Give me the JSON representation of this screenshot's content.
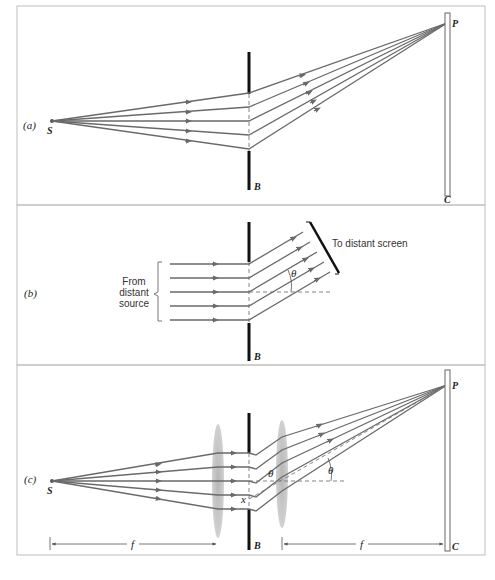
{
  "figure": {
    "panels": [
      {
        "id": "a",
        "label": "(a)",
        "source_label": "S",
        "barrier_label": "B",
        "point_label": "P",
        "screen_label": "C"
      },
      {
        "id": "b",
        "label": "(b)",
        "incoming_label_line1": "From",
        "incoming_label_line2": "distant",
        "incoming_label_line3": "source",
        "outgoing_label": "To distant screen",
        "angle_label": "θ",
        "barrier_label": "B"
      },
      {
        "id": "c",
        "label": "(c)",
        "source_label": "S",
        "barrier_label": "B",
        "point_label": "P",
        "screen_label": "C",
        "angle_label_1": "θ",
        "angle_label_2": "θ",
        "slit_offset_label": "x",
        "focal_length_left": "f",
        "focal_length_right": "f"
      }
    ],
    "colors": {
      "ray": "#6a6a6a",
      "barrier": "#111111",
      "lens": "#b8b8b8",
      "frame": "#bdbdbd"
    }
  }
}
